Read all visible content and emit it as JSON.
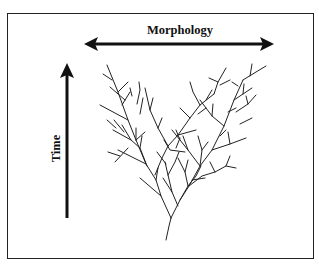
{
  "diagram": {
    "type": "phylogenetic-branching-tree",
    "horizontal_axis": {
      "label": "Morphology",
      "direction": "bidirectional"
    },
    "vertical_axis": {
      "label": "Time",
      "direction": "upward"
    },
    "colors": {
      "ink": "#111111",
      "frame": "#222222",
      "background": "#ffffff"
    }
  }
}
